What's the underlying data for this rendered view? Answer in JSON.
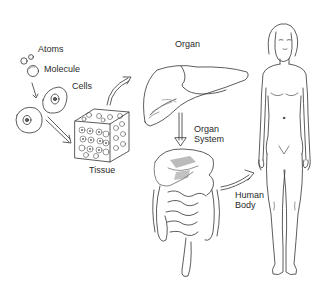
{
  "diagram": {
    "type": "levels-of-organization",
    "labels": {
      "atoms": "Atoms",
      "molecule": "Molecule",
      "cells": "Cells",
      "tissue": "Tissue",
      "organ": "Organ",
      "organ_system_line1": "Organ",
      "organ_system_line2": "System",
      "human_body_line1": "Human",
      "human_body_line2": "Body"
    },
    "sequence": [
      "Atoms",
      "Molecule",
      "Cells",
      "Tissue",
      "Organ",
      "Organ System",
      "Human Body"
    ],
    "colors": {
      "line": "#333333",
      "background": "#ffffff",
      "shade": "#9a9a9a"
    }
  }
}
